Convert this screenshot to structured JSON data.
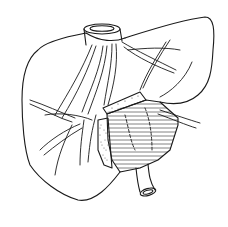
{
  "figure": {
    "colors": {
      "ink": "#1a1a1a",
      "background": "#ffffff"
    },
    "parts": [
      {
        "id": "liver-outline",
        "label": "Liver"
      },
      {
        "id": "ivc",
        "label": "Inferior vena cava"
      },
      {
        "id": "hepatic-vessels",
        "label": "Intrahepatic vessels"
      },
      {
        "id": "hatched-segment",
        "label": "Hatched segment"
      },
      {
        "id": "stippled-margin",
        "label": "Stippled margin"
      },
      {
        "id": "portal-stump",
        "label": "Vessel stump"
      }
    ]
  }
}
